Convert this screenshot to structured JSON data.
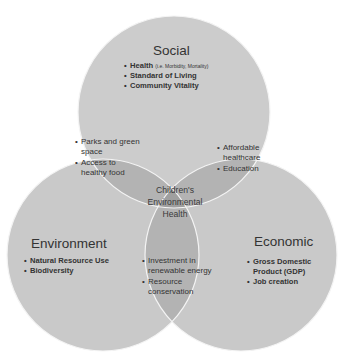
{
  "diagram": {
    "type": "venn",
    "colors": {
      "single": "#cbcbcb",
      "double": "#b2b2b2",
      "triple": "#9e9e9e",
      "outline": "#ffffff",
      "text": "#333333"
    },
    "center": {
      "line1": "Children's",
      "line2": "Environmental",
      "line3": "Health"
    },
    "social": {
      "title": "Social",
      "items": [
        {
          "text": "Health",
          "note": "(i.e. Morbidity, Mortality)"
        },
        {
          "text": "Standard of Living"
        },
        {
          "text": "Community Vitality"
        }
      ]
    },
    "environment": {
      "title": "Environment",
      "items": [
        {
          "text": "Natural Resource Use"
        },
        {
          "text": "Biodiversity"
        }
      ]
    },
    "economic": {
      "title": "Economic",
      "items": [
        {
          "text": "Gross Domestic"
        },
        {
          "text": "Product (GDP)"
        },
        {
          "text": "Job creation"
        }
      ]
    },
    "social_environment": {
      "items": [
        {
          "line1": "Parks and green",
          "line2": "space"
        },
        {
          "line1": "Access to",
          "line2": "healthy food"
        }
      ]
    },
    "social_economic": {
      "items": [
        {
          "line1": "Affordable",
          "line2": "healthcare"
        },
        {
          "line1": "Education"
        }
      ]
    },
    "environment_economic": {
      "items": [
        {
          "line1": "Investment in",
          "line2": "renewable energy"
        },
        {
          "line1": "Resource",
          "line2": "conservation"
        }
      ]
    }
  }
}
